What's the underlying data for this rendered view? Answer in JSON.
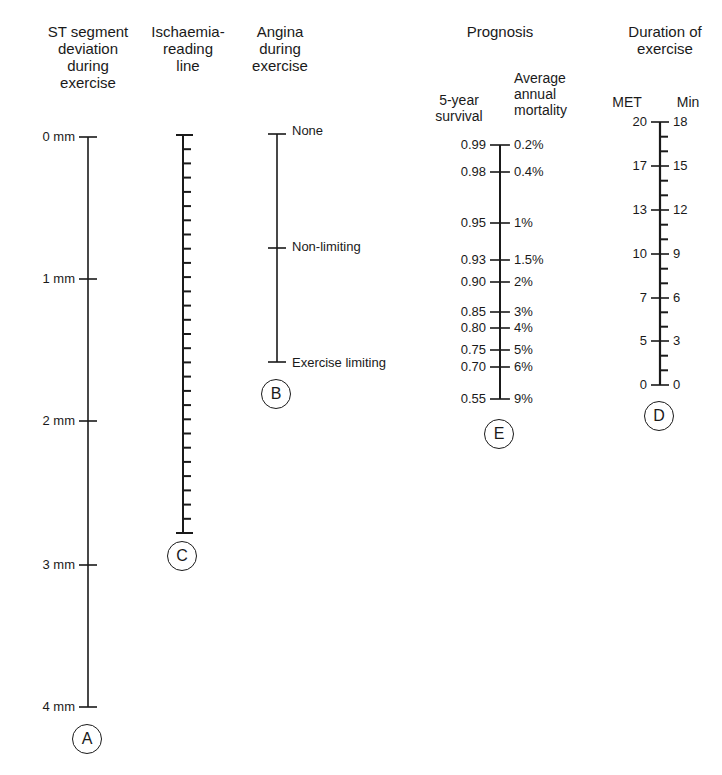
{
  "figure": {
    "type": "nomogram",
    "caption_fragment_visible": false
  },
  "scales": {
    "A": {
      "letter": "A",
      "title": "ST segment\ndeviation\nduring\nexercise",
      "ticks": [
        {
          "label": "0 mm",
          "value": 0
        },
        {
          "label": "1 mm",
          "value": 1
        },
        {
          "label": "2 mm",
          "value": 2
        },
        {
          "label": "3 mm",
          "value": 3
        },
        {
          "label": "4 mm",
          "value": 4
        }
      ]
    },
    "C": {
      "letter": "C",
      "title": "Ischaemia-\nreading\nline",
      "minor_tick_count": 28
    },
    "B": {
      "letter": "B",
      "title": "Angina\nduring\nexercise",
      "ticks": [
        {
          "label": "None"
        },
        {
          "label": "Non-limiting"
        },
        {
          "label": "Exercise limiting"
        }
      ]
    },
    "E": {
      "letter": "E",
      "title": "Prognosis",
      "left_title": "5-year\nsurvival",
      "right_title": "Average\nannual\nmortality",
      "ticks": [
        {
          "left": "0.99",
          "right": "0.2%"
        },
        {
          "left": "0.98",
          "right": "0.4%"
        },
        {
          "left": "0.95",
          "right": "1%"
        },
        {
          "left": "0.93",
          "right": "1.5%"
        },
        {
          "left": "0.90",
          "right": "2%"
        },
        {
          "left": "0.85",
          "right": "3%"
        },
        {
          "left": "0.80",
          "right": "4%"
        },
        {
          "left": "0.75",
          "right": "5%"
        },
        {
          "left": "0.70",
          "right": "6%"
        },
        {
          "left": "0.55",
          "right": "9%"
        }
      ]
    },
    "D": {
      "letter": "D",
      "title": "Duration of\nexercise",
      "left_title": "MET",
      "right_title": "Min",
      "ticks": [
        {
          "left": "20",
          "right": "18"
        },
        {
          "left": "17",
          "right": "15"
        },
        {
          "left": "13",
          "right": "12"
        },
        {
          "left": "10",
          "right": "9"
        },
        {
          "left": "7",
          "right": "6"
        },
        {
          "left": "5",
          "right": "3"
        },
        {
          "left": "0",
          "right": "0"
        }
      ]
    }
  }
}
